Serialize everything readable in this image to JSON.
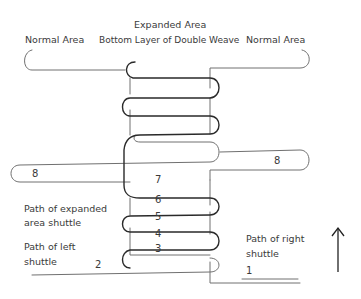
{
  "title": "Expanded Area",
  "labels": {
    "normal_area_left": "Normal Area",
    "bottom_layer": "Bottom Layer of Double Weave",
    "normal_area_right": "Normal Area",
    "expanded_shuttle_line1": "Path of expanded",
    "expanded_shuttle_line2": "area shuttle",
    "left_shuttle_line1": "Path of left",
    "left_shuttle_line2": "shuttle",
    "right_shuttle_line1": "Path of right",
    "right_shuttle_line2": "shuttle"
  },
  "pick_numbers": {
    "p1": "1",
    "p2": "2",
    "p3": "3",
    "p4": "4",
    "p5": "5",
    "p6": "6",
    "p7": "7",
    "p8_left": "8",
    "p8_right": "8"
  },
  "arrow": {
    "direction": "up",
    "meaning": "weaving direction"
  },
  "colors": {
    "thin_line": "#6a6a6a",
    "thick_line": "#2a2a2a",
    "text": "#3a3a3a"
  }
}
